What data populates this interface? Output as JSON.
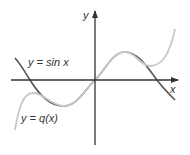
{
  "diagram": {
    "type": "function-graph",
    "axes": {
      "x_label": "x",
      "y_label": "y",
      "color": "#333333"
    },
    "curves": [
      {
        "name": "sin",
        "label": "y = sin x",
        "color": "#555555"
      },
      {
        "name": "q",
        "label": "y = q(x)",
        "color": "#c8c8c8"
      }
    ]
  }
}
